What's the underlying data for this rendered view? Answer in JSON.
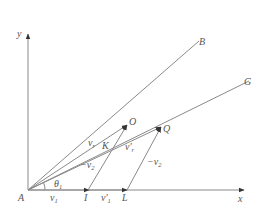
{
  "diagram": {
    "type": "vector-geometry",
    "axes": {
      "x_label": "x",
      "y_label": "y"
    },
    "points": {
      "A": "A",
      "B": "B",
      "G": "G",
      "O": "O",
      "Q": "Q",
      "K": "K",
      "I": "I",
      "L": "L"
    },
    "vector_labels": {
      "v1": {
        "base": "v",
        "sub": "1"
      },
      "v1_prime": {
        "base": "v'",
        "sub": "1"
      },
      "vr": {
        "base": "v",
        "sub": "r"
      },
      "vr_prime": {
        "base": "v'",
        "sub": "r"
      },
      "neg_v2_left": {
        "base": "−v",
        "sub": "2"
      },
      "neg_v2_right": {
        "base": "−v",
        "sub": "2"
      }
    },
    "angle_label": {
      "base": "θ",
      "sub": "1"
    },
    "colors": {
      "line": "#8a8a8a",
      "text": "#555555",
      "background": "#ffffff"
    }
  }
}
